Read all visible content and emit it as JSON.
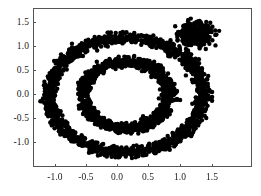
{
  "chart_data": {
    "type": "scatter",
    "title": "",
    "subtitle": "",
    "xlabel": "",
    "ylabel": "",
    "xlim": [
      -1.33,
      1.65
    ],
    "ylim": [
      -1.27,
      1.68
    ],
    "xticks": [
      -1.0,
      -0.5,
      0.0,
      0.5,
      1.0,
      1.5
    ],
    "xticklabels": [
      "-1.0",
      "-0.5",
      "0.0",
      "0.5",
      "1.0",
      "1.5"
    ],
    "yticks": [
      -1.0,
      -0.5,
      0.0,
      0.5,
      1.0,
      1.5
    ],
    "yticklabels": [
      "-1.0",
      "-0.5",
      "0.0",
      "0.5",
      "1.0",
      "1.5"
    ],
    "grid": false,
    "legend": null,
    "marker_color": "#000000",
    "marker_size": 2.2,
    "frame_color": "#555555",
    "background_color": "#ffffff",
    "series": [
      {
        "name": "outer-ring",
        "shape": "ring",
        "center": [
          0.13,
          0.0
        ],
        "radius_x": 1.22,
        "radius_y": 1.2,
        "thickness": 0.16,
        "n_points": 1500
      },
      {
        "name": "inner-ring",
        "shape": "ring",
        "center": [
          0.13,
          0.0
        ],
        "radius_x": 0.68,
        "radius_y": 0.7,
        "thickness": 0.16,
        "n_points": 1050
      },
      {
        "name": "corner-blob",
        "shape": "gaussian-blob",
        "center": [
          1.24,
          1.27
        ],
        "spread_x": 0.12,
        "spread_y": 0.11,
        "n_points": 420
      }
    ]
  }
}
